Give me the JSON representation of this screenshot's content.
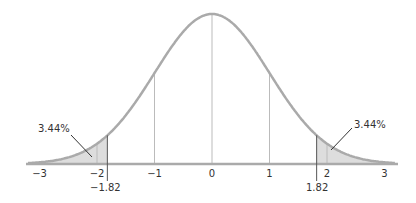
{
  "chart_data": {
    "type": "area",
    "title": "",
    "xlabel": "",
    "ylabel": "",
    "xlim": [
      -3.1,
      3.2
    ],
    "ylim": [
      0,
      0.4
    ],
    "grid": false,
    "x_ticks": [
      -3,
      -2,
      -1,
      0,
      1,
      2,
      3
    ],
    "x_tick_labels": [
      "−3",
      "−2",
      "−1",
      "0",
      "1",
      "2",
      "3"
    ],
    "vertical_lines_at": [
      -1,
      0,
      1
    ],
    "critical_values": [
      -1.82,
      1.82
    ],
    "critical_value_labels": [
      "−1.82",
      "1.82"
    ],
    "shaded_regions": [
      {
        "name": "left tail",
        "from": -3.1,
        "to": -1.82,
        "area_label": "3.44%"
      },
      {
        "name": "right tail",
        "from": 1.82,
        "to": 3.2,
        "area_label": "3.44%"
      }
    ],
    "series": [
      {
        "name": "normal pdf",
        "mean": 0,
        "sd": 1
      }
    ],
    "colors": {
      "curve": "#aaaaaa",
      "shade": "#dddddd",
      "axis": "#aaaaaa",
      "text": "#333333"
    }
  },
  "annotations": {
    "left_tail": "3.44%",
    "right_tail": "3.44%",
    "left_critical": "−1.82",
    "right_critical": "1.82"
  },
  "ticks": [
    "−3",
    "−2",
    "−1",
    "0",
    "1",
    "2",
    "3"
  ]
}
